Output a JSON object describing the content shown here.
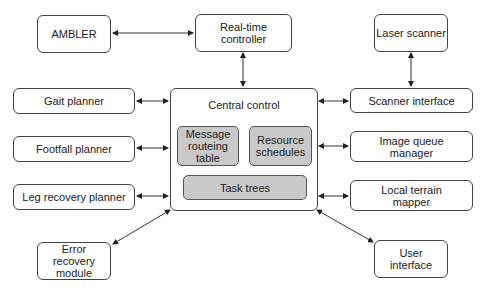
{
  "diagram": {
    "nodes": {
      "ambler": "AMBLER",
      "realtime": "Real-time controller",
      "laser": "Laser scanner",
      "gait": "Gait planner",
      "footfall": "Footfall planner",
      "leg_recovery": "Leg recovery planner",
      "error_recovery": "Error recovery module",
      "central": "Central control",
      "message_table": "Message routeing table",
      "resource": "Resource schedules",
      "task_trees": "Task trees",
      "scanner_interface": "Scanner interface",
      "image_queue": "Image queue manager",
      "terrain": "Local terrain mapper",
      "user_interface": "User interface"
    },
    "edges": [
      [
        "AMBLER",
        "Real-time controller"
      ],
      [
        "Real-time controller",
        "Central control"
      ],
      [
        "Laser scanner",
        "Scanner interface"
      ],
      [
        "Gait planner",
        "Central control"
      ],
      [
        "Footfall planner",
        "Central control"
      ],
      [
        "Leg recovery planner",
        "Central control"
      ],
      [
        "Error recovery module",
        "Central control"
      ],
      [
        "Scanner interface",
        "Central control"
      ],
      [
        "Image queue manager",
        "Central control"
      ],
      [
        "Local terrain mapper",
        "Central control"
      ],
      [
        "User interface",
        "Central control"
      ]
    ]
  }
}
